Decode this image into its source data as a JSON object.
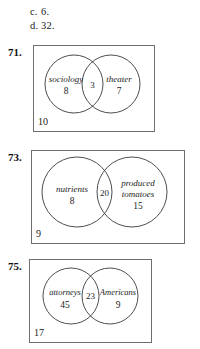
{
  "answer_choices": [
    {
      "letter": "c.",
      "value": "6."
    },
    {
      "letter": "d.",
      "value": "32."
    }
  ],
  "problems": [
    {
      "number": "71.",
      "left_set": {
        "label": "sociology",
        "count": "8"
      },
      "intersection": {
        "count": "3"
      },
      "right_set": {
        "label": "theater",
        "count": "7"
      },
      "outside_count": "10"
    },
    {
      "number": "73.",
      "left_set": {
        "label": "nutrients",
        "count": "8"
      },
      "intersection": {
        "count": "20"
      },
      "right_set": {
        "label_line1": "produced",
        "label_line2": "tomatoes",
        "count": "15"
      },
      "outside_count": "9"
    },
    {
      "number": "75.",
      "left_set": {
        "label": "attorneys",
        "count": "45"
      },
      "intersection": {
        "count": "23"
      },
      "right_set": {
        "label": "Americans",
        "count": "9"
      },
      "outside_count": "17"
    }
  ],
  "colors": {
    "ink": "#1c1c1c",
    "rule": "#6e6e6e",
    "circle_stroke": "#3a3a3a",
    "page_background": "#ffffff"
  }
}
